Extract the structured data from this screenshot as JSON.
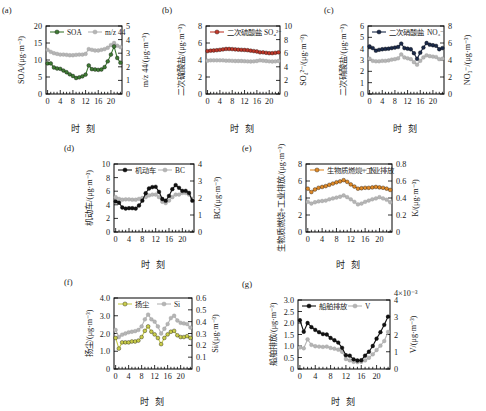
{
  "figure": {
    "x_axis_title": "时 刻",
    "panels": [
      "(a)",
      "(b)",
      "(c)",
      "(d)",
      "(e)",
      "(f)",
      "(g)"
    ]
  },
  "colors": {
    "soa_green": "#3f7a34",
    "sulfate_red": "#c0392b",
    "nitrate_navy": "#1b2a4a",
    "vehicle_black": "#111111",
    "biomass_orange": "#e08a28",
    "dust_yellow": "#c9cc4a",
    "ship_black": "#111111",
    "grey_marker": "#b5b5b5",
    "axis": "#000000"
  },
  "chart_data": [
    {
      "type": "line",
      "panel": "(a)",
      "title": "",
      "xlabel": "时 刻",
      "ylabel": "SOA/(μg·m⁻³)",
      "y2label": "m/z 44/(μg·m⁻³)",
      "x": [
        0,
        1,
        2,
        3,
        4,
        5,
        6,
        7,
        8,
        9,
        10,
        11,
        12,
        13,
        14,
        15,
        16,
        17,
        18,
        19,
        20,
        21,
        22,
        23
      ],
      "xlim": [
        -0.5,
        23.5
      ],
      "xticks": [
        0,
        4,
        8,
        12,
        16,
        20
      ],
      "ylim": [
        0,
        20
      ],
      "yticks": [
        0,
        5,
        10,
        15,
        20
      ],
      "y2lim": [
        0,
        5
      ],
      "y2ticks": [
        0,
        1,
        2,
        3,
        4,
        5
      ],
      "grid": false,
      "legend_position": "top",
      "series": [
        {
          "name": "SOA",
          "axis": "left",
          "color": "#3f7a34",
          "values": [
            9.0,
            9.0,
            7.8,
            7.5,
            7.4,
            6.9,
            6.4,
            5.8,
            5.3,
            4.7,
            4.9,
            5.2,
            5.7,
            8.4,
            7.3,
            7.2,
            7.1,
            7.2,
            7.9,
            9.6,
            11.6,
            14.0,
            10.6,
            9.2
          ]
        },
        {
          "name": "m/z 44",
          "axis": "right",
          "color": "#b5b5b5",
          "values": [
            3.25,
            3.1,
            3.0,
            2.95,
            2.9,
            2.9,
            2.88,
            2.85,
            2.85,
            2.88,
            2.9,
            2.9,
            2.95,
            3.3,
            3.25,
            3.2,
            3.2,
            3.25,
            3.3,
            3.4,
            3.6,
            3.75,
            3.55,
            3.45
          ]
        }
      ]
    },
    {
      "type": "line",
      "panel": "(b)",
      "title": "",
      "xlabel": "时 刻",
      "ylabel": "二次硫酸盐/(μg·m⁻³)",
      "y2label": "SO₄²⁻/(μg·m⁻³)",
      "x": [
        0,
        1,
        2,
        3,
        4,
        5,
        6,
        7,
        8,
        9,
        10,
        11,
        12,
        13,
        14,
        15,
        16,
        17,
        18,
        19,
        20,
        21,
        22,
        23
      ],
      "xlim": [
        -0.5,
        23.5
      ],
      "xticks": [
        0,
        4,
        8,
        12,
        16,
        20
      ],
      "ylim": [
        0,
        8
      ],
      "yticks": [
        0,
        2,
        4,
        6,
        8
      ],
      "y2lim": [
        0,
        10
      ],
      "y2ticks": [
        0,
        2,
        4,
        6,
        8,
        10
      ],
      "grid": false,
      "legend_position": "top",
      "series": [
        {
          "name": "二次硫酸盐",
          "axis": "left",
          "color": "#c0392b",
          "values": [
            5.05,
            5.1,
            5.12,
            5.15,
            5.2,
            5.25,
            5.3,
            5.3,
            5.28,
            5.25,
            5.22,
            5.2,
            5.18,
            5.15,
            5.1,
            5.05,
            5.0,
            4.9,
            4.9,
            4.85,
            4.8,
            4.8,
            4.85,
            4.9
          ]
        },
        {
          "name": "SO₄²⁻",
          "axis": "right",
          "color": "#b5b5b5",
          "values": [
            4.9,
            4.95,
            4.95,
            4.95,
            4.95,
            4.95,
            4.9,
            4.9,
            4.88,
            4.85,
            4.85,
            4.85,
            4.82,
            4.8,
            4.78,
            4.8,
            4.85,
            4.95,
            4.9,
            4.85,
            4.8,
            4.78,
            4.8,
            4.85
          ]
        }
      ]
    },
    {
      "type": "line",
      "panel": "(c)",
      "title": "",
      "xlabel": "时 刻",
      "ylabel": "二次硝酸盐/(μg·m⁻³)",
      "y2label": "NO₃⁻/(μg·m⁻³)",
      "x": [
        0,
        1,
        2,
        3,
        4,
        5,
        6,
        7,
        8,
        9,
        10,
        11,
        12,
        13,
        14,
        15,
        16,
        17,
        18,
        19,
        20,
        21,
        22,
        23
      ],
      "xlim": [
        -0.5,
        23.5
      ],
      "xticks": [
        0,
        4,
        8,
        12,
        16,
        20
      ],
      "ylim": [
        0,
        6
      ],
      "yticks": [
        0,
        1,
        2,
        3,
        4,
        5,
        6
      ],
      "y2lim": [
        0,
        8
      ],
      "y2ticks": [
        0,
        2,
        4,
        6,
        8
      ],
      "grid": false,
      "legend_position": "top",
      "series": [
        {
          "name": "二次硝酸盐",
          "axis": "left",
          "color": "#1b2a4a",
          "values": [
            4.2,
            4.05,
            3.82,
            3.9,
            3.95,
            3.98,
            4.0,
            4.05,
            4.1,
            4.15,
            4.45,
            4.05,
            4.0,
            3.95,
            3.6,
            3.1,
            3.65,
            4.1,
            4.5,
            4.35,
            4.3,
            4.25,
            3.95,
            4.05
          ]
        },
        {
          "name": "NO₃⁻",
          "axis": "right",
          "color": "#b5b5b5",
          "values": [
            4.15,
            3.9,
            3.85,
            3.85,
            3.9,
            3.9,
            3.95,
            4.05,
            4.1,
            4.2,
            4.65,
            4.3,
            4.2,
            4.1,
            3.75,
            3.45,
            3.9,
            4.3,
            4.55,
            4.45,
            4.4,
            4.35,
            4.1,
            4.15
          ]
        }
      ]
    },
    {
      "type": "line",
      "panel": "(d)",
      "title": "",
      "xlabel": "时 刻",
      "ylabel": "机动车/(μg·m⁻³)",
      "y2label": "BC/(μg·m⁻³)",
      "x": [
        0,
        1,
        2,
        3,
        4,
        5,
        6,
        7,
        8,
        9,
        10,
        11,
        12,
        13,
        14,
        15,
        16,
        17,
        18,
        19,
        20,
        21,
        22,
        23
      ],
      "xlim": [
        -0.5,
        23.5
      ],
      "xticks": [
        0,
        4,
        8,
        12,
        16,
        20
      ],
      "ylim": [
        0,
        10
      ],
      "yticks": [
        0,
        2,
        4,
        6,
        8,
        10
      ],
      "y2lim": [
        0,
        4
      ],
      "y2ticks": [
        0,
        1,
        2,
        3,
        4
      ],
      "grid": false,
      "legend_position": "top",
      "series": [
        {
          "name": "机动车",
          "axis": "left",
          "color": "#111111",
          "values": [
            4.5,
            4.3,
            3.6,
            3.45,
            3.5,
            3.5,
            3.45,
            3.9,
            4.6,
            5.7,
            6.4,
            6.6,
            6.65,
            5.9,
            4.85,
            4.6,
            5.3,
            6.3,
            6.9,
            6.5,
            6.05,
            6.05,
            5.75,
            4.6
          ]
        },
        {
          "name": "BC",
          "axis": "right",
          "color": "#b5b5b5",
          "values": [
            2.05,
            1.95,
            1.9,
            1.92,
            1.92,
            1.9,
            1.9,
            1.95,
            2.0,
            2.05,
            2.15,
            2.2,
            2.2,
            2.05,
            1.78,
            1.7,
            1.85,
            2.05,
            2.2,
            2.2,
            2.3,
            2.3,
            2.2,
            1.95
          ]
        }
      ]
    },
    {
      "type": "line",
      "panel": "(e)",
      "title": "",
      "xlabel": "时 刻",
      "ylabel": "生物质燃烧+工业排放/(μg·m⁻³)",
      "y2label": "K/(μg·m⁻³)",
      "x": [
        0,
        1,
        2,
        3,
        4,
        5,
        6,
        7,
        8,
        9,
        10,
        11,
        12,
        13,
        14,
        15,
        16,
        17,
        18,
        19,
        20,
        21,
        22,
        23
      ],
      "xlim": [
        -0.5,
        23.5
      ],
      "xticks": [
        0,
        4,
        8,
        12,
        16,
        20
      ],
      "ylim": [
        0,
        8
      ],
      "yticks": [
        0,
        2,
        4,
        6,
        8
      ],
      "y2lim": [
        0,
        0.8
      ],
      "y2ticks": [
        0,
        0.2,
        0.4,
        0.6,
        0.8
      ],
      "grid": false,
      "legend_position": "top",
      "series": [
        {
          "name": "生物质燃烧+工业排放",
          "axis": "left",
          "color": "#e08a28",
          "values": [
            5.1,
            4.7,
            5.0,
            5.2,
            5.3,
            5.4,
            5.55,
            5.7,
            5.85,
            5.95,
            6.1,
            5.9,
            5.6,
            5.35,
            5.1,
            5.15,
            5.2,
            5.2,
            5.25,
            5.3,
            5.25,
            5.2,
            5.1,
            4.95
          ]
        },
        {
          "name": "K",
          "axis": "right",
          "color": "#b5b5b5",
          "values": [
            0.355,
            0.335,
            0.35,
            0.36,
            0.365,
            0.37,
            0.385,
            0.395,
            0.405,
            0.415,
            0.43,
            0.41,
            0.385,
            0.355,
            0.325,
            0.335,
            0.355,
            0.37,
            0.385,
            0.395,
            0.41,
            0.395,
            0.38,
            0.35
          ]
        }
      ]
    },
    {
      "type": "line",
      "panel": "(f)",
      "title": "",
      "xlabel": "时 刻",
      "ylabel": "扬尘/(μg·m⁻³)",
      "y2label": "Si/(μg·m⁻³)",
      "x": [
        0,
        1,
        2,
        3,
        4,
        5,
        6,
        7,
        8,
        9,
        10,
        11,
        12,
        13,
        14,
        15,
        16,
        17,
        18,
        19,
        20,
        21,
        22,
        23
      ],
      "xlim": [
        -0.5,
        23.5
      ],
      "xticks": [
        0,
        4,
        8,
        12,
        16,
        20
      ],
      "ylim": [
        0,
        4.0
      ],
      "yticks": [
        0,
        1.0,
        2.0,
        3.0,
        4.0
      ],
      "y2lim": [
        0,
        0.6
      ],
      "y2ticks": [
        0,
        0.1,
        0.2,
        0.3,
        0.4,
        0.5,
        0.6
      ],
      "grid": false,
      "legend_position": "top",
      "series": [
        {
          "name": "扬尘",
          "axis": "left",
          "color": "#c9cc4a",
          "values": [
            1.75,
            1.15,
            1.5,
            1.5,
            1.5,
            1.55,
            1.55,
            1.6,
            1.8,
            2.15,
            2.4,
            2.1,
            1.95,
            1.75,
            1.4,
            1.75,
            1.95,
            2.1,
            2.15,
            1.9,
            1.8,
            1.8,
            1.85,
            1.75
          ]
        },
        {
          "name": "Si",
          "axis": "right",
          "color": "#b5b5b5",
          "values": [
            0.33,
            0.27,
            0.29,
            0.3,
            0.31,
            0.315,
            0.32,
            0.33,
            0.36,
            0.42,
            0.46,
            0.42,
            0.4,
            0.36,
            0.3,
            0.34,
            0.38,
            0.43,
            0.45,
            0.41,
            0.39,
            0.385,
            0.38,
            0.35
          ]
        }
      ]
    },
    {
      "type": "line",
      "panel": "(g)",
      "title": "",
      "xlabel": "时 刻",
      "ylabel": "船舶排放/(μg·m⁻³)",
      "y2label": "V/(μg·m⁻³)",
      "y2_exponent": "×10⁻³",
      "x": [
        0,
        1,
        2,
        3,
        4,
        5,
        6,
        7,
        8,
        9,
        10,
        11,
        12,
        13,
        14,
        15,
        16,
        17,
        18,
        19,
        20,
        21,
        22,
        23
      ],
      "xlim": [
        -0.5,
        23.5
      ],
      "xticks": [
        0,
        4,
        8,
        12,
        16,
        20
      ],
      "ylim": [
        0,
        3.0
      ],
      "yticks": [
        0,
        0.5,
        1.0,
        1.5,
        2.0,
        2.5,
        3.0
      ],
      "y2lim": [
        0,
        4
      ],
      "y2ticks": [
        0,
        1,
        2,
        3,
        4
      ],
      "grid": false,
      "legend_position": "top",
      "series": [
        {
          "name": "船舶排放",
          "axis": "left",
          "color": "#111111",
          "values": [
            2.12,
            1.62,
            2.0,
            1.82,
            1.7,
            1.6,
            1.52,
            1.5,
            1.35,
            1.25,
            1.15,
            0.92,
            0.6,
            0.58,
            0.42,
            0.37,
            0.38,
            0.58,
            0.75,
            1.0,
            1.32,
            1.6,
            1.92,
            2.28
          ]
        },
        {
          "name": "V",
          "axis": "right",
          "color": "#b5b5b5",
          "values": [
            1.25,
            1.2,
            1.72,
            1.4,
            1.32,
            1.3,
            1.28,
            1.3,
            1.22,
            1.18,
            1.12,
            1.0,
            0.58,
            0.5,
            0.42,
            0.4,
            0.42,
            0.5,
            0.65,
            0.85,
            1.1,
            1.35,
            1.62,
            2.15
          ]
        }
      ]
    }
  ]
}
